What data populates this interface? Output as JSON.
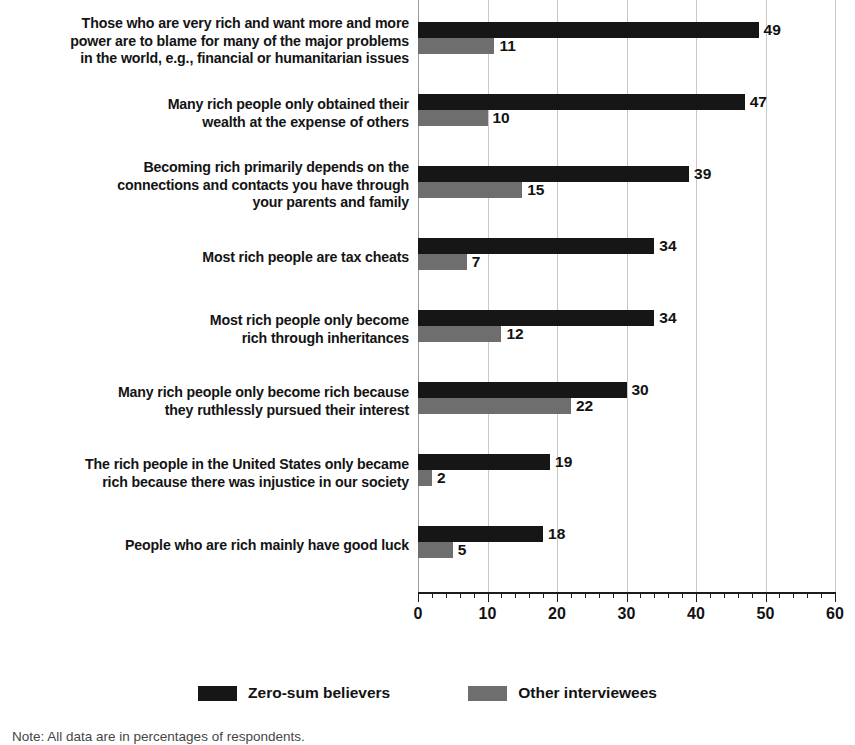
{
  "chart_data": {
    "type": "bar",
    "orientation": "horizontal",
    "title": "",
    "subtitle": "",
    "xlabel": "",
    "ylabel": "",
    "xlim": [
      0,
      60
    ],
    "xticks": [
      0,
      10,
      20,
      30,
      40,
      50,
      60
    ],
    "xtick_labels": [
      "0",
      "10",
      "20",
      "30",
      "40",
      "50",
      "60"
    ],
    "minor_tick_step": 2,
    "grid": true,
    "grid_axis": "x",
    "legend_position": "bottom-center",
    "value_labels": true,
    "categories": [
      "Those who are very rich and want more and more\npower are to blame for many of the major problems\nin the world, e.g., financial or humanitarian issues",
      "Many rich people only obtained their\nwealth at the expense of others",
      "Becoming rich primarily depends on the\nconnections and contacts you have through\nyour parents and family",
      "Most rich people are tax cheats",
      "Most rich people only become\nrich through inheritances",
      "Many rich people only become rich because\nthey ruthlessly pursued their interest",
      "The rich people in the United States only became\nrich because there was injustice in our society",
      "People who are rich mainly have good luck"
    ],
    "series": [
      {
        "name": "Zero-sum believers",
        "color": "#161616",
        "values": [
          49,
          47,
          39,
          34,
          34,
          30,
          19,
          18
        ]
      },
      {
        "name": "Other interviewees",
        "color": "#6e6e6e",
        "values": [
          11,
          10,
          15,
          7,
          12,
          22,
          2,
          5
        ]
      }
    ]
  },
  "legend": {
    "items": [
      {
        "label": "Zero-sum believers",
        "swatch": "series-a"
      },
      {
        "label": "Other interviewees",
        "swatch": "series-b"
      }
    ]
  },
  "note": {
    "text": "Note: All data are in percentages of respondents."
  }
}
